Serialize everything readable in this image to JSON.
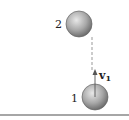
{
  "diagram": {
    "balls": [
      {
        "label": "2",
        "cx": 79,
        "cy": 24,
        "r": 13
      },
      {
        "label": "1",
        "cx": 95,
        "cy": 97,
        "r": 13
      }
    ],
    "velocity": {
      "symbol": "v",
      "subscript": "1"
    },
    "colors": {
      "ball": "#9a9a9a",
      "ground": "#888888",
      "dashed": "#999999"
    }
  }
}
